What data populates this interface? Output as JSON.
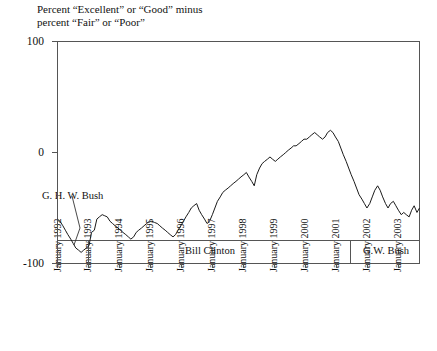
{
  "chart_data": {
    "type": "line",
    "title": "Percent “Excellent” or “Good” minus\npercent “Fair” or “Poor”",
    "title_line1": "Percent “Excellent” or “Good” minus",
    "title_line2": "percent “Fair” or “Poor”",
    "xlabel": "",
    "ylabel": "",
    "ylim": [
      -100,
      100
    ],
    "xlim": [
      "January 1992",
      "July 2003"
    ],
    "grid": false,
    "legend": "none",
    "line_color": "#1a1a1a",
    "frame_color": "#555555",
    "ytick_labels": [
      "100",
      "0",
      "-100"
    ],
    "ytick_values": [
      100,
      0,
      -100
    ],
    "xtick_labels": [
      "January 1992",
      "January 1993",
      "January 1994",
      "January 1995",
      "January 1996",
      "January 1997",
      "January 1998",
      "January 1999",
      "January 2000",
      "January 2001",
      "January 2002",
      "January 2003"
    ],
    "annotations": [
      {
        "text": "G. H. W. Bush",
        "x_label": "January 1992",
        "note": "leader line points down-right to start of series"
      }
    ],
    "president_bands": [
      {
        "label": "",
        "start": "January 1992",
        "end": "January 1993"
      },
      {
        "label": "Bill Clinton",
        "start": "January 1993",
        "end": "January 2001"
      },
      {
        "label": "G.W. Bush",
        "start": "January 2001",
        "end": "July 2003"
      }
    ],
    "series": [
      {
        "name": "Net positive rating",
        "x": [
          1992.0,
          1992.08,
          1992.17,
          1992.25,
          1992.33,
          1992.42,
          1992.5,
          1992.58,
          1992.67,
          1992.75,
          1992.83,
          1992.92,
          1993.0,
          1993.08,
          1993.17,
          1993.25,
          1993.33,
          1993.42,
          1993.5,
          1993.58,
          1993.67,
          1993.75,
          1993.83,
          1993.92,
          1994.0,
          1994.08,
          1994.17,
          1994.25,
          1994.33,
          1994.42,
          1994.5,
          1994.58,
          1994.67,
          1994.75,
          1994.83,
          1994.92,
          1995.0,
          1995.08,
          1995.17,
          1995.25,
          1995.33,
          1995.42,
          1995.5,
          1995.58,
          1995.67,
          1995.75,
          1995.83,
          1995.92,
          1996.0,
          1996.08,
          1996.17,
          1996.25,
          1996.33,
          1996.42,
          1996.5,
          1996.58,
          1996.67,
          1996.75,
          1996.83,
          1996.92,
          1997.0,
          1997.08,
          1997.17,
          1997.25,
          1997.33,
          1997.42,
          1997.5,
          1997.58,
          1997.67,
          1997.75,
          1997.83,
          1997.92,
          1998.0,
          1998.08,
          1998.17,
          1998.25,
          1998.33,
          1998.42,
          1998.5,
          1998.58,
          1998.67,
          1998.75,
          1998.83,
          1998.92,
          1999.0,
          1999.08,
          1999.17,
          1999.25,
          1999.33,
          1999.42,
          1999.5,
          1999.58,
          1999.67,
          1999.75,
          1999.83,
          1999.92,
          2000.0,
          2000.08,
          2000.17,
          2000.25,
          2000.33,
          2000.42,
          2000.5,
          2000.58,
          2000.67,
          2000.75,
          2000.83,
          2000.92,
          2001.0,
          2001.08,
          2001.17,
          2001.25,
          2001.33,
          2001.42,
          2001.5,
          2001.58,
          2001.67,
          2001.75,
          2001.83,
          2001.92,
          2002.0,
          2002.08,
          2002.17,
          2002.25,
          2002.33,
          2002.42,
          2002.5,
          2002.58,
          2002.67,
          2002.75,
          2002.83,
          2002.92,
          2003.0,
          2003.08,
          2003.17,
          2003.25,
          2003.33,
          2003.42,
          2003.5
        ],
        "values": [
          -60,
          -62,
          -66,
          -70,
          -74,
          -78,
          -82,
          -86,
          -88,
          -90,
          -88,
          -86,
          -84,
          -72,
          -70,
          -60,
          -58,
          -56,
          -57,
          -58,
          -62,
          -64,
          -66,
          -68,
          -70,
          -72,
          -74,
          -76,
          -78,
          -76,
          -72,
          -70,
          -68,
          -66,
          -64,
          -62,
          -62,
          -63,
          -64,
          -66,
          -68,
          -70,
          -72,
          -74,
          -76,
          -74,
          -70,
          -66,
          -62,
          -58,
          -54,
          -50,
          -48,
          -46,
          -52,
          -56,
          -60,
          -64,
          -62,
          -56,
          -50,
          -44,
          -40,
          -36,
          -34,
          -32,
          -30,
          -28,
          -26,
          -24,
          -22,
          -20,
          -18,
          -22,
          -26,
          -30,
          -20,
          -14,
          -10,
          -8,
          -6,
          -4,
          -6,
          -8,
          -6,
          -4,
          -2,
          0,
          2,
          4,
          6,
          6,
          8,
          10,
          12,
          12,
          14,
          16,
          18,
          16,
          14,
          12,
          14,
          18,
          20,
          18,
          14,
          10,
          4,
          -2,
          -8,
          -14,
          -20,
          -26,
          -32,
          -38,
          -42,
          -46,
          -50,
          -46,
          -40,
          -34,
          -30,
          -34,
          -40,
          -46,
          -50,
          -46,
          -44,
          -48,
          -52,
          -56,
          -54,
          -56,
          -58,
          -52,
          -48,
          -54,
          -50
        ]
      }
    ]
  }
}
